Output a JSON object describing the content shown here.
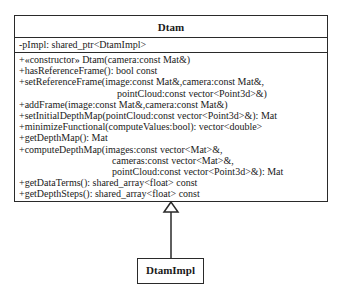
{
  "diagram": {
    "type": "uml-class",
    "classes": [
      {
        "name": "Dtam",
        "attributes": [
          "-pImpl: shared_ptr<DtamImpl>"
        ],
        "operations": [
          {
            "lines": [
              "+«constructor» Dtam(camera:const Mat&)"
            ]
          },
          {
            "lines": [
              "+hasReferenceFrame(): bool const"
            ]
          },
          {
            "lines": [
              "+setReferenceFrame(image:const Mat&,camera:const Mat&,",
              "pointCloud:const vector<Point3d>&)"
            ]
          },
          {
            "lines": [
              "+addFrame(image:const Mat&,camera:const Mat&)"
            ]
          },
          {
            "lines": [
              "+setInitialDepthMap(pointCloud:const vector<Point3d>&): Mat"
            ]
          },
          {
            "lines": [
              "+minimizeFunctional(computeValues:bool): vector<double>"
            ]
          },
          {
            "lines": [
              "+getDepthMap(): Mat"
            ]
          },
          {
            "lines": [
              "+computeDepthMap(images:const vector<Mat>&,",
              "cameras:const vector<Mat>&,",
              "pointCloud:const vector<Point3d>&): Mat"
            ]
          },
          {
            "lines": [
              "+getDataTerms(): shared_array<float> const"
            ]
          },
          {
            "lines": [
              "+getDepthSteps(): shared_array<float> const"
            ]
          }
        ]
      },
      {
        "name": "DtamImpl",
        "attributes": [],
        "operations": []
      }
    ],
    "relationships": [
      {
        "type": "generalization",
        "from": "DtamImpl",
        "to": "Dtam",
        "arrowhead": "hollow-triangle"
      }
    ],
    "colors": {
      "line": "#2a2a2a",
      "background": "#ffffff",
      "text": "#1a1a1a"
    }
  }
}
